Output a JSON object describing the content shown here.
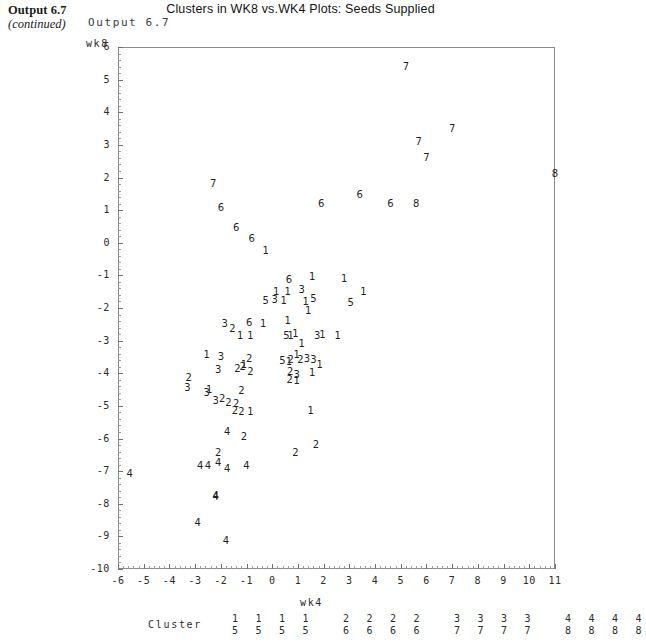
{
  "book": {
    "output_label": "Output 6.7",
    "continued_label": "(continued)",
    "sas_output_label": "Output 6.7"
  },
  "chart_data": {
    "type": "scatter",
    "title": "Clusters in WK8 vs.WK4 Plots: Seeds Supplied",
    "xlabel": "wk4",
    "ylabel": "wk8",
    "xlim": [
      -6,
      11
    ],
    "ylim": [
      -10,
      6
    ],
    "grid": false,
    "legend_position": "bottom",
    "xticks": [
      "-6",
      "-5",
      "-4",
      "-3",
      "-2",
      "-1",
      "0",
      "1",
      "2",
      "3",
      "4",
      "5",
      "6",
      "7",
      "8",
      "9",
      "10",
      "11"
    ],
    "yticks": [
      "6",
      "5",
      "4",
      "3",
      "2",
      "1",
      "0",
      "-1",
      "-2",
      "-3",
      "-4",
      "-5",
      "-6",
      "-7",
      "-8",
      "-9",
      "-10"
    ],
    "marker_style": "cluster-number-glyph",
    "legend_title": "Cluster",
    "legend_entries": [
      {
        "top": "1",
        "bottom": "5"
      },
      {
        "top": "1",
        "bottom": "5"
      },
      {
        "top": "1",
        "bottom": "5"
      },
      {
        "top": "1",
        "bottom": "5"
      },
      {
        "top": "2",
        "bottom": "6"
      },
      {
        "top": "2",
        "bottom": "6"
      },
      {
        "top": "2",
        "bottom": "6"
      },
      {
        "top": "2",
        "bottom": "6"
      },
      {
        "top": "3",
        "bottom": "7"
      },
      {
        "top": "3",
        "bottom": "7"
      },
      {
        "top": "3",
        "bottom": "7"
      },
      {
        "top": "3",
        "bottom": "7"
      },
      {
        "top": "4",
        "bottom": "8"
      },
      {
        "top": "4",
        "bottom": "8"
      },
      {
        "top": "4",
        "bottom": "8"
      },
      {
        "top": "4",
        "bottom": "8"
      }
    ],
    "points": [
      {
        "label": "7",
        "x": 5.2,
        "y": 5.4
      },
      {
        "label": "7",
        "x": 7.0,
        "y": 3.5
      },
      {
        "label": "7",
        "x": 5.7,
        "y": 3.1
      },
      {
        "label": "7",
        "x": 6.0,
        "y": 2.6
      },
      {
        "label": "8",
        "x": 11.0,
        "y": 2.1
      },
      {
        "label": "7",
        "x": -2.3,
        "y": 1.8
      },
      {
        "label": "6",
        "x": 3.4,
        "y": 1.45
      },
      {
        "label": "6",
        "x": 1.9,
        "y": 1.2
      },
      {
        "label": "6",
        "x": 4.6,
        "y": 1.2
      },
      {
        "label": "8",
        "x": 5.6,
        "y": 1.2
      },
      {
        "label": "6",
        "x": -2.0,
        "y": 1.05
      },
      {
        "label": "6",
        "x": -1.4,
        "y": 0.45
      },
      {
        "label": "6",
        "x": -0.8,
        "y": 0.1
      },
      {
        "label": "1",
        "x": -0.25,
        "y": -0.25
      },
      {
        "label": "1",
        "x": 1.55,
        "y": -1.05
      },
      {
        "label": "1",
        "x": 2.8,
        "y": -1.1
      },
      {
        "label": "6",
        "x": 0.65,
        "y": -1.15
      },
      {
        "label": "1",
        "x": 0.15,
        "y": -1.5
      },
      {
        "label": "1",
        "x": 0.6,
        "y": -1.5
      },
      {
        "label": "3",
        "x": 1.15,
        "y": -1.45
      },
      {
        "label": "1",
        "x": 3.55,
        "y": -1.5
      },
      {
        "label": "5",
        "x": -0.25,
        "y": -1.8
      },
      {
        "label": "3",
        "x": 0.1,
        "y": -1.75
      },
      {
        "label": "1",
        "x": 0.45,
        "y": -1.78
      },
      {
        "label": "1",
        "x": 1.3,
        "y": -1.82
      },
      {
        "label": "5",
        "x": 1.6,
        "y": -1.72
      },
      {
        "label": "5",
        "x": 3.05,
        "y": -1.85
      },
      {
        "label": "1",
        "x": 1.4,
        "y": -2.1
      },
      {
        "label": "6",
        "x": -0.9,
        "y": -2.45
      },
      {
        "label": "1",
        "x": -0.35,
        "y": -2.5
      },
      {
        "label": "1",
        "x": 0.6,
        "y": -2.4
      },
      {
        "label": "3",
        "x": -1.85,
        "y": -2.5
      },
      {
        "label": "2",
        "x": -1.55,
        "y": -2.65
      },
      {
        "label": "1",
        "x": -1.25,
        "y": -2.85
      },
      {
        "label": "1",
        "x": -0.85,
        "y": -2.85
      },
      {
        "label": "5",
        "x": 0.55,
        "y": -2.85
      },
      {
        "label": "1",
        "x": 0.72,
        "y": -2.85
      },
      {
        "label": "1",
        "x": 0.9,
        "y": -2.8
      },
      {
        "label": "3",
        "x": 1.75,
        "y": -2.85
      },
      {
        "label": "1",
        "x": 1.95,
        "y": -2.82
      },
      {
        "label": "1",
        "x": 2.55,
        "y": -2.85
      },
      {
        "label": "1",
        "x": 1.15,
        "y": -3.1
      },
      {
        "label": "1",
        "x": -2.55,
        "y": -3.45
      },
      {
        "label": "3",
        "x": -2.0,
        "y": -3.5
      },
      {
        "label": "2",
        "x": -0.9,
        "y": -3.55
      },
      {
        "label": "5",
        "x": 0.4,
        "y": -3.62
      },
      {
        "label": "1",
        "x": 0.65,
        "y": -3.65
      },
      {
        "label": "2",
        "x": 0.72,
        "y": -3.6
      },
      {
        "label": "1",
        "x": 0.95,
        "y": -3.45
      },
      {
        "label": "2",
        "x": 1.1,
        "y": -3.58
      },
      {
        "label": "3",
        "x": 1.35,
        "y": -3.55
      },
      {
        "label": "3",
        "x": 1.6,
        "y": -3.6
      },
      {
        "label": "1",
        "x": 1.85,
        "y": -3.75
      },
      {
        "label": "3",
        "x": -2.1,
        "y": -3.9
      },
      {
        "label": "2",
        "x": -1.35,
        "y": -3.88
      },
      {
        "label": "2",
        "x": -1.15,
        "y": -3.82
      },
      {
        "label": "1",
        "x": -1.1,
        "y": -3.75
      },
      {
        "label": "2",
        "x": -0.85,
        "y": -3.95
      },
      {
        "label": "2",
        "x": 0.7,
        "y": -3.95
      },
      {
        "label": "3",
        "x": 0.95,
        "y": -4.05
      },
      {
        "label": "1",
        "x": 1.55,
        "y": -4.0
      },
      {
        "label": "2",
        "x": -3.25,
        "y": -4.15
      },
      {
        "label": "2",
        "x": 0.68,
        "y": -4.2
      },
      {
        "label": "1",
        "x": 0.95,
        "y": -4.25
      },
      {
        "label": "3",
        "x": -3.3,
        "y": -4.45
      },
      {
        "label": "3",
        "x": -2.55,
        "y": -4.6
      },
      {
        "label": "1",
        "x": -2.45,
        "y": -4.5
      },
      {
        "label": "2",
        "x": -1.2,
        "y": -4.55
      },
      {
        "label": "3",
        "x": -2.2,
        "y": -4.85
      },
      {
        "label": "2",
        "x": -1.95,
        "y": -4.8
      },
      {
        "label": "2",
        "x": -1.7,
        "y": -4.9
      },
      {
        "label": "2",
        "x": -1.4,
        "y": -4.95
      },
      {
        "label": "2",
        "x": -1.45,
        "y": -5.15
      },
      {
        "label": "2",
        "x": -1.2,
        "y": -5.2
      },
      {
        "label": "1",
        "x": -0.85,
        "y": -5.2
      },
      {
        "label": "1",
        "x": 1.5,
        "y": -5.15
      },
      {
        "label": "4",
        "x": -1.75,
        "y": -5.8
      },
      {
        "label": "2",
        "x": -1.1,
        "y": -5.95
      },
      {
        "label": "2",
        "x": -2.1,
        "y": -6.45
      },
      {
        "label": "2",
        "x": 0.9,
        "y": -6.45
      },
      {
        "label": "2",
        "x": 1.7,
        "y": -6.2
      },
      {
        "label": "4",
        "x": -2.8,
        "y": -6.85
      },
      {
        "label": "4",
        "x": -2.5,
        "y": -6.85
      },
      {
        "label": "4",
        "x": -2.1,
        "y": -6.75
      },
      {
        "label": "4",
        "x": -1.75,
        "y": -6.95
      },
      {
        "label": "4",
        "x": -1.0,
        "y": -6.85
      },
      {
        "label": "4",
        "x": -5.55,
        "y": -7.1
      },
      {
        "label": "4",
        "x": -2.2,
        "y": -7.75
      },
      {
        "label": "4",
        "x": -2.2,
        "y": -7.8
      },
      {
        "label": "4",
        "x": -2.9,
        "y": -8.6
      },
      {
        "label": "4",
        "x": -1.8,
        "y": -9.15
      }
    ]
  }
}
